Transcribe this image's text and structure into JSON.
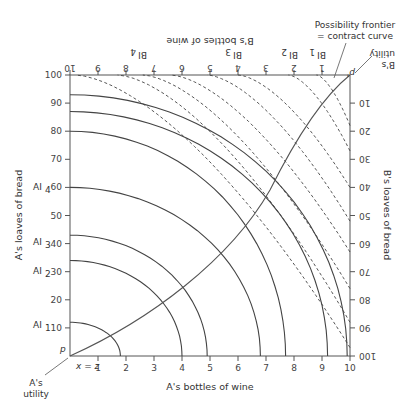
{
  "figure": {
    "axes": {
      "bottom_title": "A's bottles of wine",
      "left_title": "A's loaves of bread",
      "top_title": "B's bottles of wine",
      "right_title": "B's loaves of bread",
      "bottom_ticks": [
        "1",
        "2",
        "3",
        "4",
        "5",
        "6",
        "7",
        "8",
        "9",
        "10"
      ],
      "left_ticks": [
        "10",
        "20",
        "30",
        "40",
        "50",
        "60",
        "70",
        "80",
        "90",
        "100"
      ],
      "top_ticks": [
        "1",
        "2",
        "3",
        "4",
        "5",
        "6",
        "7",
        "8",
        "9",
        "10"
      ],
      "right_ticks": [
        "10",
        "20",
        "30",
        "40",
        "50",
        "60",
        "70",
        "80",
        "90",
        "100"
      ]
    },
    "origin_labels": {
      "a_origin": "p",
      "a_utility_line1": "A's",
      "a_utility_line2": "utility",
      "x_equals_z": "x = z",
      "b_origin": "p'",
      "b_utility_line1": "B's",
      "b_utility_line2": "utility"
    },
    "a_levels": [
      {
        "label": "AI",
        "sub": "1",
        "value": "10"
      },
      {
        "label": "AI",
        "sub": "2",
        "value": "30"
      },
      {
        "label": "AI",
        "sub": "3",
        "value": "40"
      },
      {
        "label": "AI",
        "sub": "4",
        "value": "60"
      }
    ],
    "b_levels": [
      {
        "label": "BI",
        "sub": "1"
      },
      {
        "label": "BI",
        "sub": "2"
      },
      {
        "label": "BI",
        "sub": "3"
      },
      {
        "label": "BI",
        "sub": "4"
      }
    ],
    "frontier_label_line1": "Possibility frontier",
    "frontier_label_line2": "= contract curve"
  },
  "chart_data": {
    "type": "edgeworth_box",
    "title": "",
    "box": {
      "wine_total": 10,
      "bread_total": 100
    },
    "xlabel": "A's bottles of wine",
    "ylabel": "A's loaves of bread",
    "x2label": "B's bottles of wine (reversed, from right)",
    "y2label": "B's loaves of bread (reversed, from top)",
    "xlim": [
      0,
      10
    ],
    "ylim": [
      0,
      100
    ],
    "a_indifference_curves_solid": [
      {
        "x_intercept": 1.8,
        "y_intercept": 12
      },
      {
        "x_intercept": 4.0,
        "y_intercept": 34
      },
      {
        "x_intercept": 4.9,
        "y_intercept": 43
      },
      {
        "x_intercept": 6.8,
        "y_intercept": 60
      },
      {
        "x_intercept": 7.7,
        "y_intercept": 80
      },
      {
        "x_intercept": 9.2,
        "y_intercept": 87
      },
      {
        "x_intercept": 9.9,
        "y_intercept": 93
      }
    ],
    "b_indifference_curves_dashed": [
      {
        "b_wine_intercept": 1.2,
        "b_bread_intercept": 18
      },
      {
        "b_wine_intercept": 2.2,
        "b_bread_intercept": 27
      },
      {
        "b_wine_intercept": 4.0,
        "b_bread_intercept": 40
      },
      {
        "b_wine_intercept": 5.1,
        "b_bread_intercept": 52
      },
      {
        "b_wine_intercept": 6.4,
        "b_bread_intercept": 63
      },
      {
        "b_wine_intercept": 7.4,
        "b_bread_intercept": 76
      },
      {
        "b_wine_intercept": 8.3,
        "b_bread_intercept": 88
      },
      {
        "b_wine_intercept": 9.8,
        "b_bread_intercept": 97
      }
    ],
    "contract_curve": [
      [
        0,
        0
      ],
      [
        1.5,
        11
      ],
      [
        3,
        24
      ],
      [
        4.3,
        37
      ],
      [
        5.3,
        49
      ],
      [
        6.3,
        62
      ],
      [
        7.3,
        75
      ],
      [
        8.3,
        86
      ],
      [
        9.3,
        94
      ],
      [
        10,
        100
      ]
    ],
    "annotations": [
      "Possibility frontier = contract curve",
      "A's utility",
      "B's utility",
      "p",
      "p'",
      "x = z",
      "AI1",
      "AI2",
      "AI3",
      "AI4",
      "BI1",
      "BI2",
      "BI3",
      "BI4"
    ],
    "grid": false
  }
}
